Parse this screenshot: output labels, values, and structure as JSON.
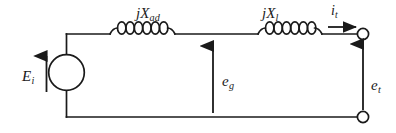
{
  "diagram": {
    "stroke_color": "#1a1a1a",
    "background_color": "#ffffff",
    "labels": {
      "reactance_armature": {
        "base": "jX",
        "subscript": "ad"
      },
      "reactance_leakage": {
        "base": "jX",
        "subscript": "l"
      },
      "current_terminal": {
        "base": "i",
        "subscript": "t"
      },
      "emf_internal": {
        "base": "E",
        "subscript": "i"
      },
      "voltage_airgap": {
        "base": "e",
        "subscript": "g"
      },
      "voltage_terminal": {
        "base": "e",
        "subscript": "t"
      }
    },
    "components": [
      {
        "name": "voltage-source",
        "type": "circle-source",
        "label": "E_i"
      },
      {
        "name": "inductor-armature",
        "type": "inductor",
        "label": "jX_ad",
        "turns": 7
      },
      {
        "name": "inductor-leakage",
        "type": "inductor",
        "label": "jX_l",
        "turns": 7
      },
      {
        "name": "terminal-top",
        "type": "open-terminal"
      },
      {
        "name": "terminal-bottom",
        "type": "open-terminal"
      }
    ],
    "arrows": [
      {
        "name": "current-arrow",
        "direction": "right",
        "label": "i_t"
      },
      {
        "name": "emf-arrow",
        "direction": "up",
        "label": "E_i"
      },
      {
        "name": "airgap-voltage-arrow",
        "direction": "up",
        "label": "e_g"
      },
      {
        "name": "terminal-voltage-arrow",
        "direction": "up",
        "label": "e_t"
      }
    ]
  }
}
